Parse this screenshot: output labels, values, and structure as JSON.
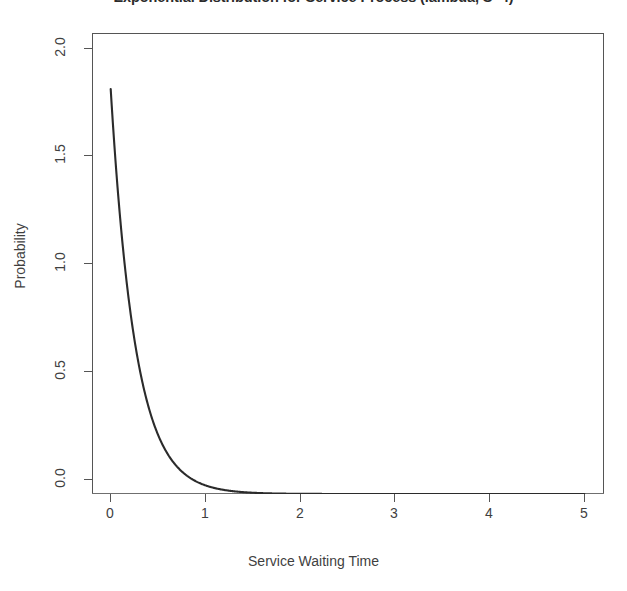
{
  "chart_data": {
    "type": "line",
    "title": "Exponential Distribution for Service Process (lambda, S=4)",
    "subtitle": "",
    "xlabel": "Service Waiting Time",
    "ylabel": "Probability",
    "xlim": [
      0,
      5.2
    ],
    "ylim": [
      0.0,
      2.13
    ],
    "grid": false,
    "legend": null,
    "legend_position": "none",
    "annotations": [],
    "xticks": [
      "0",
      "1",
      "2",
      "3",
      "4",
      "5"
    ],
    "xtick_values": [
      0,
      1,
      2,
      3,
      4,
      5
    ],
    "yticks": [
      "0.0",
      "0.5",
      "1.0",
      "1.5",
      "2.0"
    ],
    "ytick_values": [
      0.0,
      0.5,
      1.0,
      1.5,
      2.0
    ],
    "series": [
      {
        "name": "Exponential PDF (rate = 4)",
        "color": "#2b2b2b",
        "rate": 4,
        "x": [
          0.19,
          0.23,
          0.28,
          0.32,
          0.35,
          0.4,
          0.45,
          0.5,
          0.55,
          0.6,
          0.65,
          0.7,
          0.75,
          0.8,
          0.85,
          0.9,
          0.95,
          1.0,
          1.1,
          1.2,
          1.3,
          1.4,
          1.5,
          1.75,
          2.0,
          2.25,
          2.5,
          2.75,
          3.0,
          3.5,
          4.0,
          4.5,
          5.0
        ],
        "y": [
          1.87,
          1.59,
          1.3,
          1.11,
          0.99,
          0.81,
          0.66,
          0.54,
          0.44,
          0.36,
          0.3,
          0.24,
          0.2,
          0.16,
          0.13,
          0.11,
          0.09,
          0.07,
          0.05,
          0.03,
          0.02,
          0.015,
          0.01,
          0.004,
          0.001,
          0.0005,
          0.0002,
          0.0001,
          1e-05,
          1e-06,
          1e-07,
          1e-08,
          1e-09
        ]
      }
    ],
    "baseline": {
      "name": "zero-reference-line",
      "y": 0.0,
      "color": "#8a8a8a"
    }
  }
}
